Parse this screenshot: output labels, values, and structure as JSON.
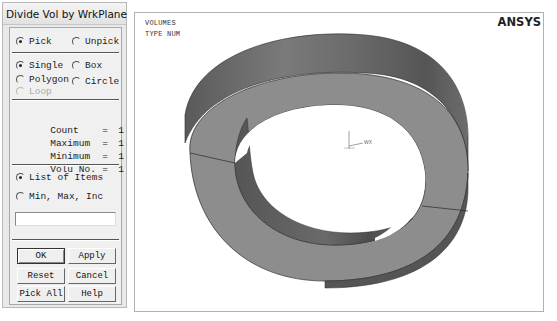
{
  "dialog": {
    "title": "Divide Vol by WrkPlane",
    "mode_group": [
      {
        "label": "Pick",
        "selected": true
      },
      {
        "label": "Unpick",
        "selected": false
      }
    ],
    "method_group": [
      {
        "label": "Single",
        "selected": true
      },
      {
        "label": "Box",
        "selected": false
      },
      {
        "label": "Polygon",
        "selected": false
      },
      {
        "label": "Circle",
        "selected": false
      },
      {
        "label": "Loop",
        "selected": false,
        "disabled": true
      }
    ],
    "stats": [
      {
        "key": "Count",
        "eq": "=",
        "value": "1"
      },
      {
        "key": "Maximum",
        "eq": "=",
        "value": "1"
      },
      {
        "key": "Minimum",
        "eq": "=",
        "value": "1"
      },
      {
        "key": "Volu No.",
        "eq": "=",
        "value": "1"
      }
    ],
    "input_group": [
      {
        "label": "List of Items",
        "selected": true
      },
      {
        "label": "Min, Max, Inc",
        "selected": false
      }
    ],
    "entry_value": "",
    "buttons": {
      "ok": "OK",
      "apply": "Apply",
      "reset": "Reset",
      "cancel": "Cancel",
      "pick_all": "Pick All",
      "help": "Help"
    }
  },
  "viewport": {
    "line1": "VOLUMES",
    "line2": "TYPE NUM",
    "brand": "ANSYS",
    "wp_label": "WX",
    "colors": {
      "face": "#8e8e8e",
      "outer_wall": "#6f6f6f",
      "inner_wall": "#5e5e5e",
      "edge": "#2a2a2a"
    }
  }
}
